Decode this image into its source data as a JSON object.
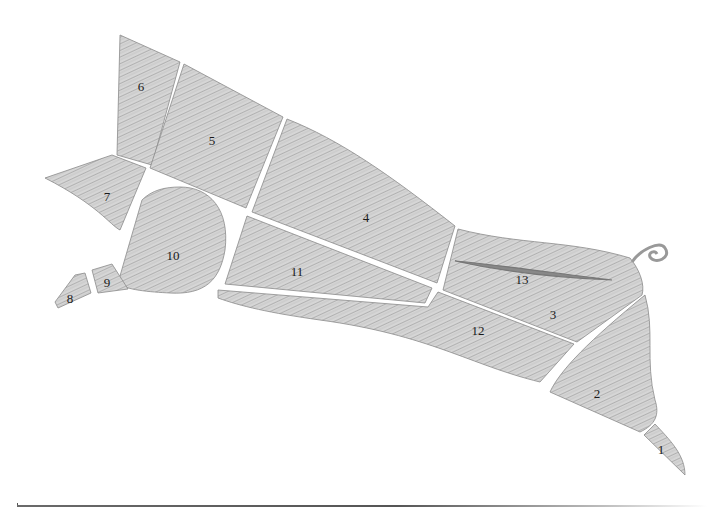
{
  "diagram": {
    "fill_color": "#cfcfcf",
    "stroke_color": "#8a8a8a",
    "gap_color": "#ffffff",
    "cuts": [
      {
        "id": "1",
        "label": "1",
        "x": 661,
        "y": 449
      },
      {
        "id": "2",
        "label": "2",
        "x": 597,
        "y": 393
      },
      {
        "id": "3",
        "label": "3",
        "x": 553,
        "y": 314
      },
      {
        "id": "4",
        "label": "4",
        "x": 366,
        "y": 217
      },
      {
        "id": "5",
        "label": "5",
        "x": 212,
        "y": 140
      },
      {
        "id": "6",
        "label": "6",
        "x": 141,
        "y": 86
      },
      {
        "id": "7",
        "label": "7",
        "x": 107,
        "y": 196
      },
      {
        "id": "8",
        "label": "8",
        "x": 70,
        "y": 298
      },
      {
        "id": "9",
        "label": "9",
        "x": 107,
        "y": 282
      },
      {
        "id": "10",
        "label": "10",
        "x": 173,
        "y": 255
      },
      {
        "id": "11",
        "label": "11",
        "x": 297,
        "y": 271
      },
      {
        "id": "12",
        "label": "12",
        "x": 478,
        "y": 330
      },
      {
        "id": "13",
        "label": "13",
        "x": 522,
        "y": 279
      }
    ]
  },
  "footer": {
    "rule": "horizontal-gradient-line"
  }
}
